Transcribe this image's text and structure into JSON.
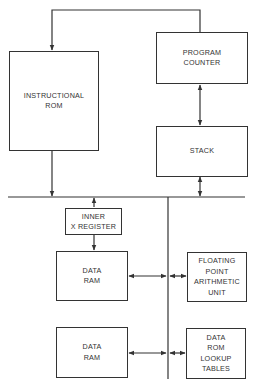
{
  "diagram": {
    "type": "block diagram",
    "colors": {
      "line": "#333333",
      "background": "#ffffff",
      "text": "#333333"
    },
    "blocks": {
      "instructional_rom": {
        "lines": [
          "INSTRUCTIONAL",
          "ROM"
        ]
      },
      "program_counter": {
        "lines": [
          "PROGRAM",
          "COUNTER"
        ]
      },
      "stack": {
        "lines": [
          "STACK"
        ]
      },
      "inner_x_register": {
        "lines": [
          "INNER",
          "X REGISTER"
        ]
      },
      "data_ram_1": {
        "lines": [
          "DATA",
          "RAM"
        ]
      },
      "fpu": {
        "lines": [
          "FLOATING",
          "POINT",
          "ARITHMETIC",
          "UNIT"
        ]
      },
      "data_ram_2": {
        "lines": [
          "DATA",
          "RAM"
        ]
      },
      "data_rom": {
        "lines": [
          "DATA",
          "ROM",
          "LOOKUP",
          "TABLES"
        ]
      }
    },
    "connections": [
      {
        "from": "Program Counter",
        "to": "Instructional ROM",
        "direction": "one-way"
      },
      {
        "from": "Program Counter",
        "to": "Stack",
        "direction": "two-way"
      },
      {
        "from": "Instructional ROM",
        "to": "Bus",
        "direction": "one-way"
      },
      {
        "from": "Stack",
        "to": "Bus",
        "direction": "two-way"
      },
      {
        "from": "Bus",
        "to": "Inner X Register",
        "direction": "two-way"
      },
      {
        "from": "Inner X Register",
        "to": "Data RAM",
        "direction": "one-way"
      },
      {
        "from": "Data RAM",
        "to": "Vertical Bus",
        "direction": "two-way"
      },
      {
        "from": "Vertical Bus",
        "to": "Floating Point Arithmetic Unit",
        "direction": "two-way"
      },
      {
        "from": "Data RAM (2)",
        "to": "Vertical Bus",
        "direction": "two-way"
      },
      {
        "from": "Vertical Bus",
        "to": "Data ROM Lookup Tables",
        "direction": "two-way"
      }
    ]
  }
}
